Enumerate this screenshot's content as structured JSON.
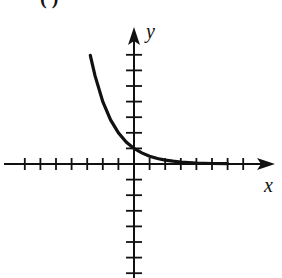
{
  "figure": {
    "panel_label": "( )",
    "x_axis_label": "x",
    "y_axis_label": "y"
  },
  "chart_data": {
    "type": "line",
    "title": "",
    "xlabel": "x",
    "ylabel": "y",
    "xlim": [
      -7,
      9
    ],
    "ylim": [
      -7,
      8
    ],
    "grid": false,
    "tick_spacing": 1,
    "x_ticks": [
      -7,
      -6,
      -5,
      -4,
      -3,
      -2,
      -1,
      1,
      2,
      3,
      4,
      5,
      6,
      7
    ],
    "y_ticks": [
      -7,
      -6,
      -5,
      -4,
      -3,
      -2,
      -1,
      1,
      2,
      3,
      4,
      5,
      6,
      7
    ],
    "series": [
      {
        "name": "y = 2^(-x)",
        "x": [
          -2.8,
          -2.5,
          -2,
          -1.5,
          -1,
          -0.5,
          0,
          0.5,
          1,
          1.5,
          2,
          2.5,
          3,
          4,
          5,
          6
        ],
        "y": [
          6.96,
          5.66,
          4.0,
          2.83,
          2.0,
          1.41,
          1.0,
          0.71,
          0.5,
          0.35,
          0.25,
          0.18,
          0.13,
          0.06,
          0.03,
          0.02
        ]
      }
    ],
    "colors": {
      "axis": "#111111",
      "curve": "#111111"
    }
  }
}
